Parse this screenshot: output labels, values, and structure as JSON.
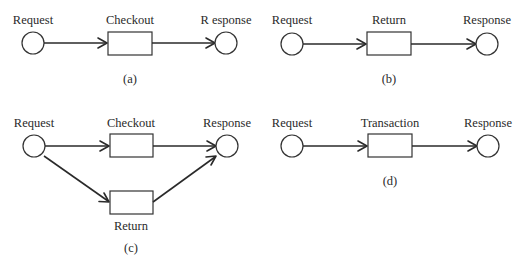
{
  "colors": {
    "stroke": "#2a2a2a",
    "background": "#ffffff"
  },
  "diagrams": {
    "a": {
      "caption": "(a)",
      "places": [
        {
          "label": "Request",
          "cx": 33,
          "cy": 43
        },
        {
          "label": "R esponse",
          "cx": 226,
          "cy": 43
        }
      ],
      "transitions": [
        {
          "label": "Checkout",
          "x": 108,
          "y": 32,
          "w": 44,
          "h": 23
        }
      ]
    },
    "b": {
      "caption": "(b)",
      "places": [
        {
          "label": "Request",
          "cx": 292,
          "cy": 44
        },
        {
          "label": "Response",
          "cx": 487,
          "cy": 44
        }
      ],
      "transitions": [
        {
          "label": "Return",
          "x": 367,
          "y": 32,
          "w": 44,
          "h": 23
        }
      ]
    },
    "c": {
      "caption": "(c)",
      "places": [
        {
          "label": "Request",
          "cx": 34,
          "cy": 146
        },
        {
          "label": "Response",
          "cx": 227,
          "cy": 146
        }
      ],
      "transitions": [
        {
          "label": "Checkout",
          "x": 110,
          "y": 134,
          "w": 43,
          "h": 23
        },
        {
          "label": "Return",
          "x": 110,
          "y": 191,
          "w": 43,
          "h": 23
        }
      ]
    },
    "d": {
      "caption": "(d)",
      "places": [
        {
          "label": "Request",
          "cx": 292,
          "cy": 146
        },
        {
          "label": "Response",
          "cx": 488,
          "cy": 146
        }
      ],
      "transitions": [
        {
          "label": "Transaction",
          "x": 368,
          "y": 134,
          "w": 44,
          "h": 23
        }
      ]
    }
  }
}
